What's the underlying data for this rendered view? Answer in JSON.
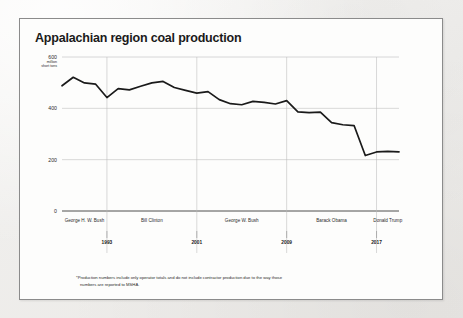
{
  "card": {
    "title": "Appalachian region coal production"
  },
  "footnote": {
    "line1": "*Production numbers include only operator totals and do not include contractor production due to the way those",
    "line2": "numbers are reported to MSHA."
  },
  "colors": {
    "line": "#1a1a1a",
    "grid": "#b9b9b9",
    "axis": "#3a3a3a",
    "card_bg": "#fdfdfc",
    "card_border": "#8b8b8b",
    "page_bg": "#f2f1ef",
    "text": "#2b2b2b"
  },
  "chart_data": {
    "type": "line",
    "title": "Appalachian region coal production",
    "xlabel": "",
    "ylabel": "million short tons",
    "ylim": [
      0,
      600
    ],
    "yticks": [
      0,
      200,
      400,
      600
    ],
    "ytick_labels": [
      "0",
      "200",
      "400",
      "600"
    ],
    "y_unit_top": "600",
    "y_unit_sub1": "million",
    "y_unit_sub2": "short tons",
    "grid": true,
    "legend": "none",
    "xlim": [
      1989,
      2019
    ],
    "x": [
      1989,
      1990,
      1991,
      1992,
      1993,
      1994,
      1995,
      1996,
      1997,
      1998,
      1999,
      2000,
      2001,
      2002,
      2003,
      2004,
      2005,
      2006,
      2007,
      2008,
      2009,
      2010,
      2011,
      2012,
      2013,
      2014,
      2015,
      2016,
      2017,
      2018,
      2019
    ],
    "values": [
      488,
      521,
      499,
      494,
      442,
      477,
      472,
      486,
      499,
      505,
      481,
      470,
      459,
      465,
      434,
      418,
      414,
      427,
      423,
      417,
      430,
      386,
      383,
      385,
      344,
      336,
      333,
      216,
      230,
      232,
      230
    ],
    "xtick_years": [
      "1993",
      "2001",
      "2009",
      "2017"
    ],
    "presidential_terms": [
      {
        "name": "George H. W. Bush",
        "start": 1989,
        "end": 1993
      },
      {
        "name": "Bill Clinton",
        "start": 1993,
        "end": 2001
      },
      {
        "name": "George W. Bush",
        "start": 2001,
        "end": 2009
      },
      {
        "name": "Barack Obama",
        "start": 2009,
        "end": 2017
      },
      {
        "name": "Donald Trump",
        "start": 2017,
        "end": 2019
      }
    ]
  }
}
